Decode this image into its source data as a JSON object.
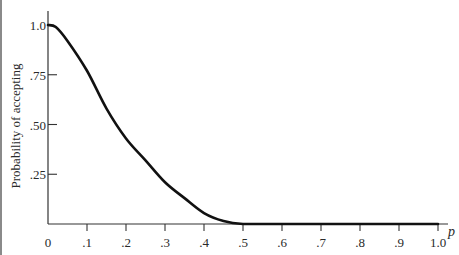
{
  "chart_data": {
    "type": "line",
    "title": "",
    "xlabel": "p",
    "ylabel": "Probability of accepting",
    "xlim": [
      0,
      1.0
    ],
    "ylim": [
      0,
      1.0
    ],
    "grid": false,
    "x_ticks": [
      {
        "value": 0,
        "label": "0"
      },
      {
        "value": 0.1,
        "label": ".1"
      },
      {
        "value": 0.2,
        "label": ".2"
      },
      {
        "value": 0.3,
        "label": ".3"
      },
      {
        "value": 0.4,
        "label": ".4"
      },
      {
        "value": 0.5,
        "label": ".5"
      },
      {
        "value": 0.6,
        "label": ".6"
      },
      {
        "value": 0.7,
        "label": ".7"
      },
      {
        "value": 0.8,
        "label": ".8"
      },
      {
        "value": 0.9,
        "label": ".9"
      },
      {
        "value": 1.0,
        "label": "1.0"
      }
    ],
    "y_ticks": [
      {
        "value": 0.25,
        "label": ".25"
      },
      {
        "value": 0.5,
        "label": ".50"
      },
      {
        "value": 0.75,
        "label": ".75"
      },
      {
        "value": 1.0,
        "label": "1.0"
      }
    ],
    "series": [
      {
        "name": "OC curve",
        "color": "#111111",
        "x": [
          0,
          0.02,
          0.05,
          0.1,
          0.15,
          0.2,
          0.25,
          0.3,
          0.35,
          0.4,
          0.45,
          0.5,
          0.6,
          0.7,
          0.8,
          0.9,
          1.0
        ],
        "y": [
          1.0,
          0.99,
          0.92,
          0.77,
          0.58,
          0.43,
          0.32,
          0.21,
          0.13,
          0.055,
          0.015,
          0.0,
          0.0,
          0.0,
          0.0,
          0.0,
          0.0
        ]
      }
    ]
  }
}
